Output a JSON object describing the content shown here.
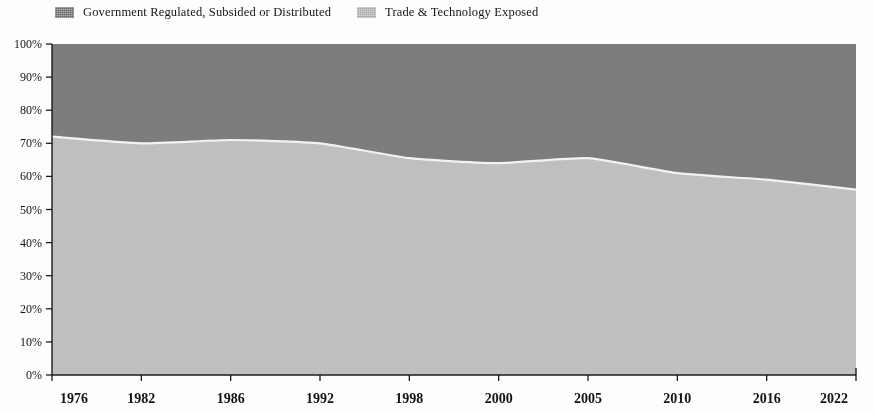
{
  "legend": {
    "position": "top-left",
    "items": [
      {
        "label": "Government Regulated, Subsided or Distributed",
        "color": "#7d7d7d",
        "swatch_icon": "legend-swatch-icon"
      },
      {
        "label": "Trade & Technology Exposed",
        "color": "#c0c0c0",
        "swatch_icon": "legend-swatch-icon"
      }
    ]
  },
  "axes": {
    "y_ticks": [
      "0%",
      "10%",
      "20%",
      "30%",
      "40%",
      "50%",
      "60%",
      "70%",
      "80%",
      "90%",
      "100%"
    ],
    "x_ticks": [
      "1976",
      "1982",
      "1986",
      "1992",
      "1998",
      "2000",
      "2005",
      "2010",
      "2016",
      "2022"
    ]
  },
  "chart_data": {
    "type": "area",
    "stacked": true,
    "normalized_to_percent": true,
    "title": "",
    "subtitle": "",
    "xlabel": "",
    "ylabel": "",
    "ylim": [
      0,
      100
    ],
    "yticks": [
      0,
      10,
      20,
      30,
      40,
      50,
      60,
      70,
      80,
      90,
      100
    ],
    "ytick_labels": [
      "0%",
      "10%",
      "20%",
      "30%",
      "40%",
      "50%",
      "60%",
      "70%",
      "80%",
      "90%",
      "100%"
    ],
    "grid": false,
    "legend_position": "top-left",
    "x": [
      1976,
      1982,
      1986,
      1992,
      1998,
      2000,
      2005,
      2010,
      2016,
      2022
    ],
    "xtick_labels": [
      "1976",
      "1982",
      "1986",
      "1992",
      "1998",
      "2000",
      "2005",
      "2010",
      "2016",
      "2022"
    ],
    "series": [
      {
        "name": "Trade & Technology Exposed",
        "color": "#c0c0c0",
        "stack_order": 1,
        "values": [
          72,
          70,
          71,
          70,
          65.5,
          64,
          65.5,
          61,
          59,
          56
        ]
      },
      {
        "name": "Government Regulated, Subsided or Distributed",
        "color": "#7d7d7d",
        "stack_order": 2,
        "values": [
          28,
          30,
          29,
          30,
          34.5,
          36,
          34.5,
          39,
          41,
          44
        ]
      }
    ],
    "annotations": []
  }
}
